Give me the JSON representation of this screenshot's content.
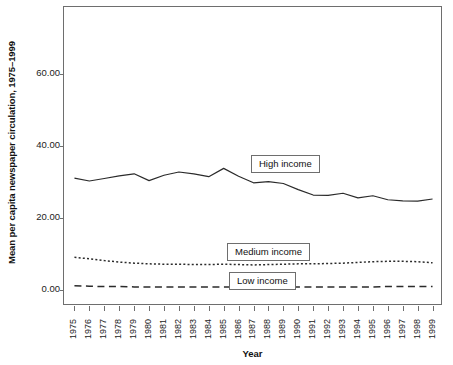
{
  "chart_data": {
    "type": "line",
    "title": "",
    "xlabel": "Year",
    "ylabel": "Mean per capita newspaper circulation, 1975–1999",
    "x": [
      1975,
      1976,
      1977,
      1978,
      1979,
      1980,
      1981,
      1982,
      1983,
      1984,
      1985,
      1986,
      1987,
      1988,
      1989,
      1990,
      1991,
      1992,
      1993,
      1994,
      1995,
      1996,
      1997,
      1998,
      1999
    ],
    "xtick_labels": [
      "1975",
      "1976",
      "1977",
      "1978",
      "1979",
      "1980",
      "1981",
      "1982",
      "1983",
      "1984",
      "1985",
      "1986",
      "1987",
      "1988",
      "1989",
      "1990",
      "1991",
      "1992",
      "1993",
      "1994",
      "1995",
      "1996",
      "1997",
      "1998",
      "1999"
    ],
    "ytick_labels": [
      "0.00",
      "20.00",
      "40.00",
      "60.00"
    ],
    "ytick_values": [
      0,
      20,
      40,
      60
    ],
    "ylim": [
      -4.5,
      78.5
    ],
    "xlim": [
      1974.3,
      1999.7
    ],
    "grid": false,
    "legend_position": "inline-boxed-labels",
    "series": [
      {
        "name": "High income",
        "style": "solid",
        "values": [
          31.0,
          30.2,
          30.9,
          31.6,
          32.2,
          30.3,
          31.8,
          32.7,
          32.2,
          31.4,
          33.7,
          31.5,
          29.7,
          30.0,
          29.5,
          27.8,
          26.3,
          26.2,
          26.8,
          25.5,
          26.1,
          25.0,
          24.7,
          24.6,
          25.2
        ]
      },
      {
        "name": "Medium income",
        "style": "dotted",
        "values": [
          9.0,
          8.6,
          8.1,
          7.7,
          7.4,
          7.2,
          7.1,
          7.1,
          7.0,
          7.0,
          7.1,
          7.0,
          6.9,
          7.0,
          7.1,
          7.2,
          7.2,
          7.3,
          7.4,
          7.6,
          7.8,
          7.9,
          7.9,
          7.8,
          7.5
        ]
      },
      {
        "name": "Low income",
        "style": "dashed",
        "values": [
          1.1,
          1.0,
          0.9,
          0.9,
          0.8,
          0.8,
          0.8,
          0.8,
          0.8,
          0.8,
          0.8,
          0.8,
          0.8,
          0.8,
          0.8,
          0.8,
          0.8,
          0.8,
          0.8,
          0.8,
          0.8,
          0.9,
          0.9,
          0.9,
          0.9
        ]
      }
    ],
    "colors": {
      "line": "#2b2b2b",
      "axis": "#6e6e6e",
      "text": "#1a1a1a",
      "background": "#ffffff"
    }
  },
  "labels": {
    "high_income": "High income",
    "medium_income": "Medium income",
    "low_income": "Low income"
  }
}
